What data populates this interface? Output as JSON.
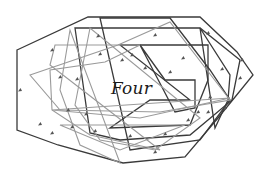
{
  "diagram": {
    "label": "Four",
    "colors": {
      "dark_stroke": "#3a3a3a",
      "light_stroke": "#9a9a9a",
      "mark": "#555555",
      "background": "#ffffff"
    },
    "polygons": [
      {
        "name": "outer-hexagon",
        "tone": "dark",
        "points": "17,50 88,17 200,17 237,52 253,75 218,118 185,157 123,163 58,145 17,130"
      },
      {
        "name": "polygon-2",
        "tone": "dark",
        "points": "75,28 165,28 200,28 240,60 232,100 190,135 120,140 90,133"
      },
      {
        "name": "polygon-3",
        "tone": "dark",
        "points": "120,45 208,45 208,80 190,125 110,128 150,100 190,100"
      },
      {
        "name": "polygon-4",
        "tone": "dark",
        "points": "100,18 170,18 210,70 230,100 200,140 130,150"
      },
      {
        "name": "polygon-5",
        "tone": "dark",
        "points": "140,45 165,80 195,80 195,108 175,112"
      },
      {
        "name": "polygon-6",
        "tone": "dark",
        "points": "200,28 230,75 228,100 215,128"
      },
      {
        "name": "polygon-7",
        "tone": "light",
        "points": "30,75 118,45 170,22 230,100 160,112 60,110"
      },
      {
        "name": "polygon-8",
        "tone": "light",
        "points": "50,65 55,45 140,45 105,62 50,70 52,110 90,135 160,150"
      },
      {
        "name": "polygon-9",
        "tone": "light",
        "points": "70,30 60,90 80,145 120,163"
      },
      {
        "name": "polygon-10",
        "tone": "light",
        "points": "90,28 75,105 100,140 155,150 200,118"
      },
      {
        "name": "polygon-11",
        "tone": "light",
        "points": "52,110 140,118 230,98"
      },
      {
        "name": "polygon-12",
        "tone": "light",
        "points": "60,125 120,150 185,125"
      }
    ],
    "marks": [
      {
        "x": 20,
        "y": 90
      },
      {
        "x": 52,
        "y": 50
      },
      {
        "x": 60,
        "y": 77
      },
      {
        "x": 77,
        "y": 79
      },
      {
        "x": 98,
        "y": 36
      },
      {
        "x": 100,
        "y": 54
      },
      {
        "x": 122,
        "y": 60
      },
      {
        "x": 132,
        "y": 55
      },
      {
        "x": 145,
        "y": 68
      },
      {
        "x": 155,
        "y": 35
      },
      {
        "x": 183,
        "y": 58
      },
      {
        "x": 170,
        "y": 72
      },
      {
        "x": 208,
        "y": 33
      },
      {
        "x": 222,
        "y": 69
      },
      {
        "x": 242,
        "y": 60
      },
      {
        "x": 240,
        "y": 78
      },
      {
        "x": 210,
        "y": 97
      },
      {
        "x": 225,
        "y": 108
      },
      {
        "x": 208,
        "y": 112
      },
      {
        "x": 188,
        "y": 120
      },
      {
        "x": 165,
        "y": 134
      },
      {
        "x": 130,
        "y": 136
      },
      {
        "x": 155,
        "y": 152
      },
      {
        "x": 95,
        "y": 131
      },
      {
        "x": 72,
        "y": 127
      },
      {
        "x": 52,
        "y": 133
      },
      {
        "x": 40,
        "y": 124
      },
      {
        "x": 68,
        "y": 110
      },
      {
        "x": 86,
        "y": 114
      },
      {
        "x": 198,
        "y": 112
      }
    ]
  }
}
